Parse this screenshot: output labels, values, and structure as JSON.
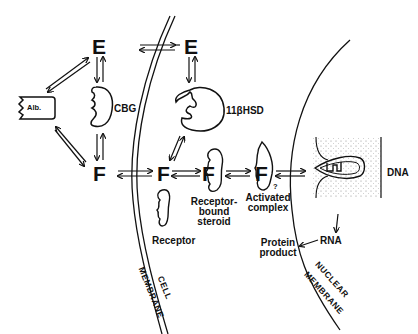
{
  "diagram": {
    "molecules": {
      "e_outside": "E",
      "e_inside": "E",
      "f_outside": "F",
      "f_inside": "F",
      "f_receptor_bound": "F",
      "f_activated": "F"
    },
    "proteins": {
      "albumin": "Alb.",
      "cbg": "CBG",
      "enzyme": "11βHSD",
      "receptor": "Receptor"
    },
    "complexes": {
      "receptor_bound_line1": "Receptor-",
      "receptor_bound_line2": "bound",
      "receptor_bound_line3": "steroid",
      "activated_line1": "Activated",
      "activated_line2": "complex",
      "question_mark": "?"
    },
    "nucleus": {
      "dna": "DNA",
      "rna": "RNA",
      "protein_line1": "Protein",
      "protein_line2": "product"
    },
    "membranes": {
      "cell_line1": "CELL",
      "cell_line2": "MEMBRANE",
      "nuclear_line1": "NUCLEAR",
      "nuclear_line2": "MEMBRANE"
    }
  }
}
